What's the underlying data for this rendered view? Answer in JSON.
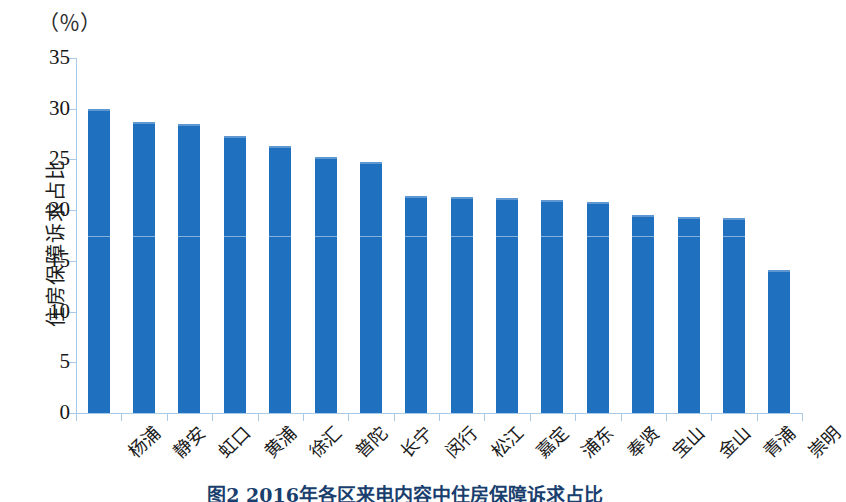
{
  "chart_data": {
    "type": "bar",
    "title": "图2  2016年各区来电内容中住房保障诉求占比",
    "unit_label": "（％）",
    "xlabel": "",
    "ylabel": "住房保障诉求占比",
    "ylim": [
      0,
      35
    ],
    "ytick_labels": [
      "0",
      "5",
      "10",
      "15",
      "20",
      "25",
      "30",
      "35"
    ],
    "ytick_values": [
      0,
      5,
      10,
      15,
      20,
      25,
      30,
      35
    ],
    "grid": false,
    "legend": "none",
    "bar_color": "#2070c0",
    "axis_color": "#a9c9e8",
    "categories": [
      "杨浦",
      "静安",
      "虹口",
      "黄浦",
      "徐汇",
      "普陀",
      "长宁",
      "闵行",
      "松江",
      "嘉定",
      "浦东",
      "奉贤",
      "宝山",
      "金山",
      "青浦",
      "崇明"
    ],
    "values": [
      30.0,
      28.7,
      28.5,
      27.3,
      26.3,
      25.2,
      24.7,
      21.4,
      21.3,
      21.2,
      21.0,
      20.8,
      19.5,
      19.3,
      19.2,
      14.1
    ]
  },
  "caption": {
    "text": "图2  2016年各区来电内容中住房保障诉求占比"
  }
}
